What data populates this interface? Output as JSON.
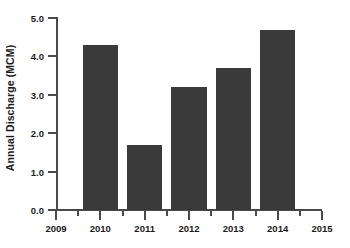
{
  "chart_data": {
    "type": "bar",
    "title": "",
    "xlabel": "",
    "ylabel": "Annual Discharge (MCM)",
    "categories": [
      "2010",
      "2011",
      "2012",
      "2013",
      "2014"
    ],
    "values": [
      4.3,
      1.7,
      3.2,
      3.7,
      4.7
    ],
    "series": [
      {
        "name": "Annual Discharge",
        "values": [
          4.3,
          1.7,
          3.2,
          3.7,
          4.7
        ]
      }
    ],
    "ylim": [
      0.0,
      5.0
    ],
    "xlim": [
      2009,
      2015
    ],
    "y_ticks": [
      0.0,
      1.0,
      2.0,
      3.0,
      4.0,
      5.0
    ],
    "y_tick_labels": [
      "0.0",
      "1.0",
      "2.0",
      "3.0",
      "4.0",
      "5.0"
    ],
    "x_ticks": [
      2009,
      2010,
      2011,
      2012,
      2013,
      2014,
      2015
    ],
    "x_tick_labels": [
      "2009",
      "2010",
      "2011",
      "2012",
      "2013",
      "2014",
      "2015"
    ],
    "x_minor_ticks": [
      2009.5,
      2010.5,
      2011.5,
      2012.5,
      2013.5,
      2014.5
    ],
    "grid": false,
    "legend": null,
    "bar_color": "#3a3a3a",
    "axis_color": "#4a4a4a",
    "text_color": "#1a1a1a",
    "background": "#ffffff"
  }
}
